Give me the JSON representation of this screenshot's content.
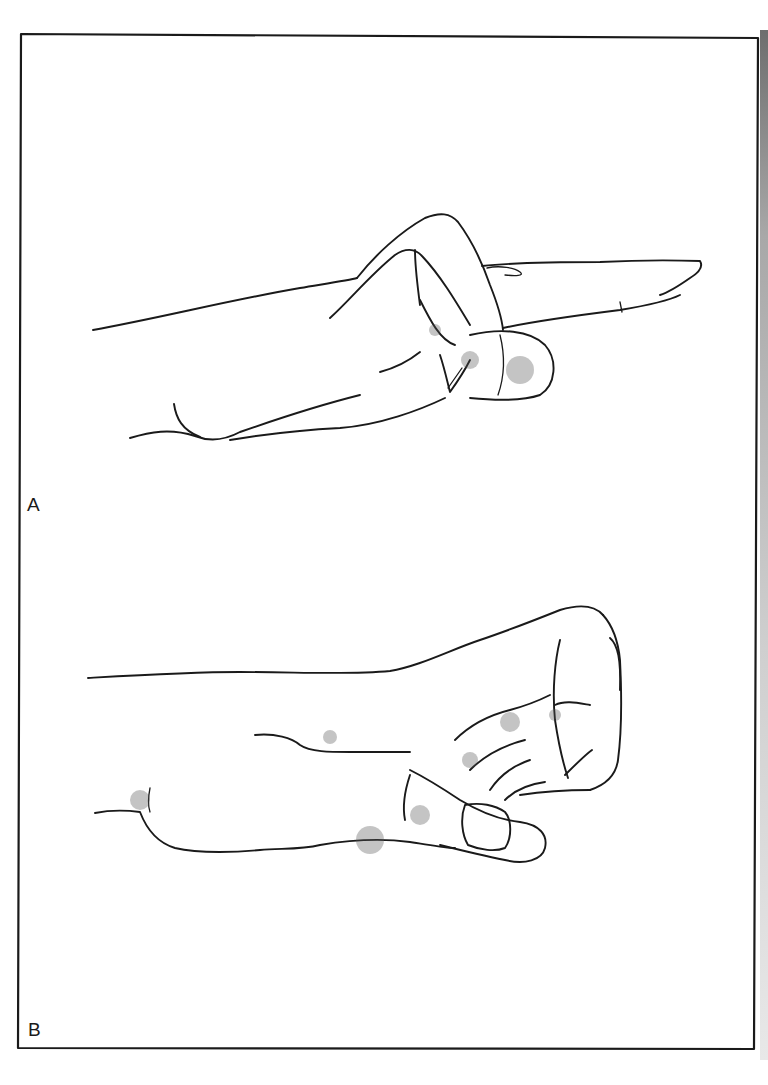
{
  "figure": {
    "type": "medical line illustration",
    "panels": [
      {
        "label": "A",
        "description": "Hand with index finger extended (pointing), remaining fingers flexed over thumb"
      },
      {
        "label": "B",
        "description": "Hand in closed fist with fingers flexed into palm and thumb tucked beneath"
      }
    ]
  },
  "style": {
    "ink_color": "#1a1a1a",
    "background": "#ffffff",
    "frame_color": "#222222"
  }
}
